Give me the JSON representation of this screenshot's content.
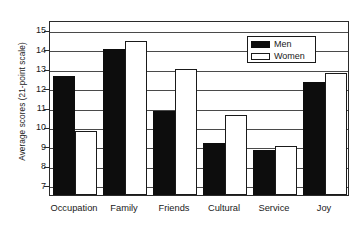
{
  "chart_data": {
    "type": "bar",
    "title": "",
    "xlabel": "",
    "ylabel": "Average scores (21-point scale)",
    "categories": [
      "Occupation",
      "Family",
      "Friends",
      "Cultural",
      "Service",
      "Joy"
    ],
    "series": [
      {
        "name": "Men",
        "color": "#0d0d0d",
        "values": [
          12.6,
          14.0,
          10.8,
          9.2,
          8.8,
          12.3
        ]
      },
      {
        "name": "Women",
        "color": "#ffffff",
        "values": [
          9.8,
          14.4,
          13.0,
          10.6,
          9.0,
          12.8
        ]
      }
    ],
    "yticks": [
      7,
      8,
      9,
      10,
      11,
      12,
      13,
      14,
      15
    ],
    "ytick_labels": [
      "7",
      "8",
      "9",
      "10",
      "11",
      "12",
      "13",
      "14",
      "15"
    ],
    "ylim": [
      6.5,
      15.5
    ],
    "grid": true,
    "legend_position": "top-right",
    "legend_entries": [
      "Men",
      "Women"
    ]
  }
}
